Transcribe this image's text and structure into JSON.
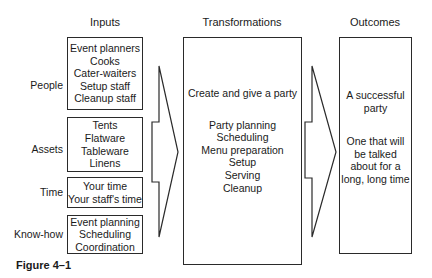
{
  "headers": {
    "inputs": "Inputs",
    "transformations": "Transformations",
    "outcomes": "Outcomes"
  },
  "inputs": [
    {
      "label": "People",
      "items": [
        "Event planners",
        "Cooks",
        "Cater-waiters",
        "Setup staff",
        "Cleanup staff"
      ]
    },
    {
      "label": "Assets",
      "items": [
        "Tents",
        "Flatware",
        "Tableware",
        "Linens"
      ]
    },
    {
      "label": "Time",
      "items": [
        "Your time",
        "Your staff's time"
      ]
    },
    {
      "label": "Know-how",
      "items": [
        "Event planning",
        "Scheduling",
        "Coordination"
      ]
    }
  ],
  "transformations": {
    "summary": "Create and give a party",
    "steps": [
      "Party planning",
      "Scheduling",
      "Menu preparation",
      "Setup",
      "Serving",
      "Cleanup"
    ]
  },
  "outcomes": {
    "primary": "A successful party",
    "secondary": [
      "One that will",
      "be talked",
      "about for a",
      "long, long time"
    ]
  },
  "caption": "Figure 4–1"
}
